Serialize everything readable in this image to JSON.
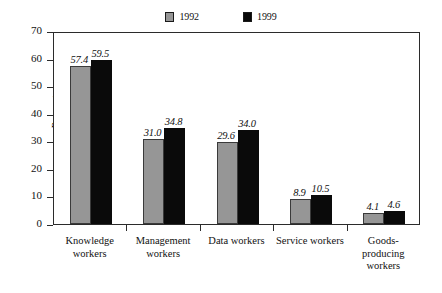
{
  "chart_data": {
    "type": "bar",
    "title": "",
    "subtitle": "",
    "xlabel": "",
    "ylabel": "Percentages",
    "ylim": [
      0,
      70
    ],
    "ytick_step": 10,
    "yticks": [
      "70",
      "60",
      "50",
      "40",
      "30",
      "20",
      "10",
      "0"
    ],
    "grid": false,
    "legend_position": "top-center",
    "categories": [
      "Knowledge workers",
      "Management workers",
      "Data workers",
      "Service workers",
      "Goods-producing workers"
    ],
    "category_lines": [
      [
        "Knowledge",
        "workers"
      ],
      [
        "Management",
        "workers"
      ],
      [
        "Data workers"
      ],
      [
        "Service workers"
      ],
      [
        "Goods-",
        "producing",
        "workers"
      ]
    ],
    "series": [
      {
        "name": "1992",
        "color": "#969696",
        "values": [
          57.4,
          31.0,
          29.6,
          8.9,
          4.1
        ],
        "labels": [
          "57.4",
          "31.0",
          "29.6",
          "8.9",
          "4.1"
        ]
      },
      {
        "name": "1999",
        "color": "#0a0a0a",
        "values": [
          59.5,
          34.8,
          34.0,
          10.5,
          4.6
        ],
        "labels": [
          "59.5",
          "34.8",
          "34.0",
          "10.5",
          "4.6"
        ]
      }
    ]
  },
  "legend": {
    "entries": [
      {
        "label": "1992",
        "swatch": "gray-swatch-icon"
      },
      {
        "label": "1999",
        "swatch": "black-swatch-icon"
      }
    ]
  },
  "colors": {
    "series_1992": "#969696",
    "series_1999": "#0a0a0a",
    "axis": "#2b2b2b",
    "text": "#111111",
    "background": "#ffffff"
  }
}
